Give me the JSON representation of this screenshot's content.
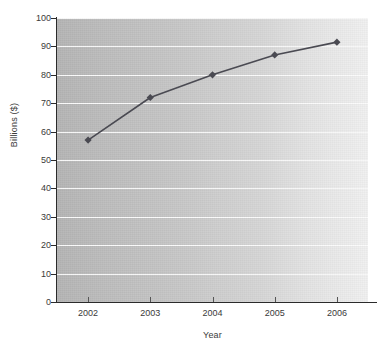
{
  "chart_data": {
    "type": "line",
    "title": "",
    "xlabel": "Year",
    "ylabel": "Billions ($)",
    "categories": [
      "2002",
      "2003",
      "2004",
      "2005",
      "2006"
    ],
    "x": [
      2002,
      2003,
      2004,
      2005,
      2006
    ],
    "values": [
      57,
      72,
      80,
      87,
      91.5
    ],
    "series": [
      {
        "name": "Billions ($)",
        "values": [
          57,
          72,
          80,
          87,
          91.5
        ]
      }
    ],
    "ylim": [
      0,
      100
    ],
    "y_ticks": [
      0,
      10,
      20,
      30,
      40,
      50,
      60,
      70,
      80,
      90,
      100
    ],
    "y_tick_labels": [
      "0",
      "10",
      "20",
      "30",
      "40",
      "50",
      "60",
      "70",
      "80",
      "90",
      "100"
    ],
    "x_tick_labels": [
      "2002",
      "2003",
      "2004",
      "2005",
      "2006"
    ],
    "grid": "horizontal",
    "legend": "none",
    "marker": "diamond",
    "line_color": "#4a4a52",
    "marker_color": "#4a4a52",
    "plot_background": "gray-gradient",
    "gridline_color": "#fbfbfb",
    "axis_color": "#2b2b2b",
    "text_color": "#3a3a3a"
  }
}
